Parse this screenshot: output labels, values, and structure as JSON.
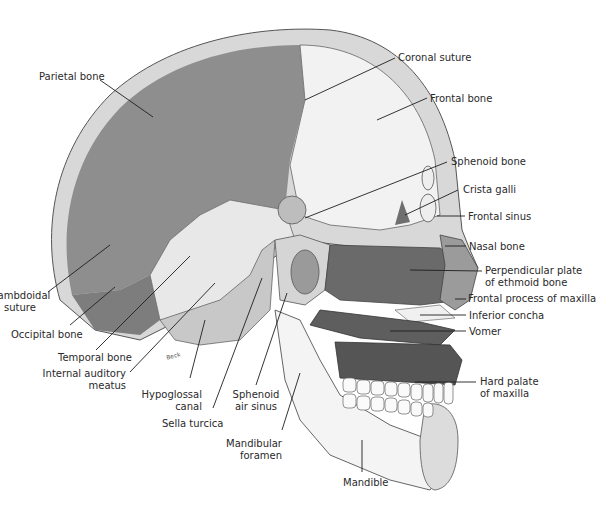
{
  "diagram": {
    "signature": "Beck",
    "colors": {
      "background": "#ffffff",
      "parietal": "#8e8e8e",
      "frontal": "#f2f2f2",
      "temporal": "#e6e6e6",
      "ethmoid": "#6a6a6a",
      "vomer": "#5e5e5e",
      "mandible": "#f4f4f4",
      "diploe": "#d8d8d8",
      "line": "#1e1e1e",
      "text": "#2a2a2a"
    },
    "labels": [
      {
        "id": "parietal-bone",
        "lines": [
          "Parietal bone"
        ]
      },
      {
        "id": "coronal-suture",
        "lines": [
          "Coronal suture"
        ]
      },
      {
        "id": "frontal-bone",
        "lines": [
          "Frontal bone"
        ]
      },
      {
        "id": "sphenoid-bone",
        "lines": [
          "Sphenoid bone"
        ]
      },
      {
        "id": "crista-galli",
        "lines": [
          "Crista galli"
        ]
      },
      {
        "id": "frontal-sinus",
        "lines": [
          "Frontal sinus"
        ]
      },
      {
        "id": "nasal-bone",
        "lines": [
          "Nasal bone"
        ]
      },
      {
        "id": "perpendicular-plate",
        "lines": [
          "Perpendicular plate",
          "of ethmoid bone"
        ]
      },
      {
        "id": "frontal-process-maxilla",
        "lines": [
          "Frontal process of maxilla"
        ]
      },
      {
        "id": "inferior-concha",
        "lines": [
          "Inferior concha"
        ]
      },
      {
        "id": "vomer",
        "lines": [
          "Vomer"
        ]
      },
      {
        "id": "hard-palate",
        "lines": [
          "Hard palate",
          "of maxilla"
        ]
      },
      {
        "id": "lambdoidal-suture",
        "lines": [
          "Lambdoidal",
          "suture"
        ]
      },
      {
        "id": "occipital-bone",
        "lines": [
          "Occipital bone"
        ]
      },
      {
        "id": "temporal-bone",
        "lines": [
          "Temporal bone"
        ]
      },
      {
        "id": "internal-auditory-meatus",
        "lines": [
          "Internal auditory",
          "meatus"
        ]
      },
      {
        "id": "hypoglossal-canal",
        "lines": [
          "Hypoglossal",
          "canal"
        ]
      },
      {
        "id": "sella-turcica",
        "lines": [
          "Sella turcica"
        ]
      },
      {
        "id": "sphenoid-air-sinus",
        "lines": [
          "Sphenoid",
          "air sinus"
        ]
      },
      {
        "id": "mandibular-foramen",
        "lines": [
          "Mandibular",
          "foramen"
        ]
      },
      {
        "id": "mandible",
        "lines": [
          "Mandible"
        ]
      }
    ]
  }
}
